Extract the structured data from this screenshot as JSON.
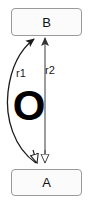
{
  "diagram": {
    "type": "node-edge-graph",
    "canvas": {
      "width": 91,
      "height": 203,
      "background": "#ffffff"
    },
    "nodes": [
      {
        "id": "B",
        "label": "B",
        "shape": "rounded-rectangle",
        "x": 11,
        "y": 8,
        "width": 71,
        "height": 28,
        "fill": "#fbfbfb",
        "stroke": "#9a9a9a"
      },
      {
        "id": "A",
        "label": "A",
        "shape": "rounded-rectangle",
        "x": 11,
        "y": 169,
        "width": 71,
        "height": 27,
        "fill": "#fbfbfb",
        "stroke": "#9a9a9a"
      }
    ],
    "edges": [
      {
        "id": "r1",
        "label": "r1",
        "from": "A",
        "to": "B",
        "style": "curved",
        "curve_direction": "left",
        "head_marker": "solid-arrow",
        "tail_marker": "hollow-triangle",
        "stroke": "#1a1a1a",
        "label_x": 16,
        "label_y": 68
      },
      {
        "id": "r2",
        "label": "r2",
        "from": "A",
        "to": "B",
        "style": "straight",
        "curve_direction": "none",
        "head_marker": "solid-arrow",
        "tail_marker": "hollow-triangle",
        "stroke": "#555555",
        "label_x": 45,
        "label_y": 65
      }
    ],
    "annotations": [
      {
        "id": "O",
        "text": "O",
        "x": 9,
        "y": 84,
        "font_size": 42,
        "weight": "bold",
        "color": "#000000"
      }
    ]
  }
}
